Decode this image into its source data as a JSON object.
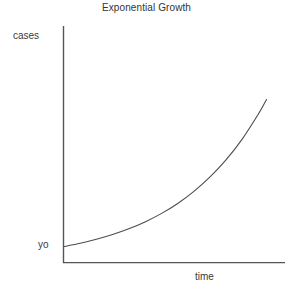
{
  "chart_data": {
    "type": "line",
    "title": "Exponential Growth",
    "xlabel": "time",
    "ylabel": "cases",
    "grid": false,
    "legend": false,
    "axis_style": "open-corner-two-axis",
    "annotations": [
      {
        "name": "initial-value-label",
        "text": "yo",
        "axis": "y",
        "meaning": "initial number of cases at time zero"
      }
    ],
    "tick_labels": {
      "x": [],
      "y": [
        "yo"
      ]
    },
    "xlim": [
      0,
      1
    ],
    "ylim": [
      0,
      1
    ],
    "series": [
      {
        "name": "exponential growth curve",
        "x": [
          0.0,
          0.08,
          0.16,
          0.24,
          0.32,
          0.4,
          0.48,
          0.56,
          0.64,
          0.72,
          0.8,
          0.88,
          0.96,
          1.0
        ],
        "y": [
          0.068,
          0.082,
          0.099,
          0.119,
          0.143,
          0.172,
          0.207,
          0.249,
          0.3,
          0.361,
          0.434,
          0.522,
          0.628,
          0.689
        ],
        "form": "y = y0 * exp(k * t)",
        "color": "#4d4d4d"
      }
    ],
    "colors": {
      "background": "#ffffff",
      "axis": "#555555",
      "curve": "#4d4d4d",
      "text": "#3a3a3a",
      "title_text": "#333333"
    }
  },
  "labels": {
    "title": "Exponential Growth",
    "y_axis": "cases",
    "y_origin": "yo",
    "x_axis": "time"
  }
}
